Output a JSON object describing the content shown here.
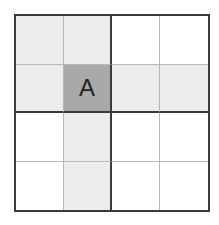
{
  "puzzle": {
    "size": 4,
    "box_size": 2,
    "colors": {
      "border": "#3a3a3a",
      "thin_line": "#b8b8b8",
      "highlight": "#ececec",
      "selected": "#a9a9a9",
      "empty": "#ffffff",
      "text": "#222222"
    },
    "selected_cell": {
      "row": 2,
      "col": 2,
      "label": "A"
    },
    "cells": [
      [
        {
          "text": "",
          "state": "light"
        },
        {
          "text": "",
          "state": "light"
        },
        {
          "text": "",
          "state": "empty"
        },
        {
          "text": "",
          "state": "empty"
        }
      ],
      [
        {
          "text": "",
          "state": "light"
        },
        {
          "text": "A",
          "state": "selected"
        },
        {
          "text": "",
          "state": "light"
        },
        {
          "text": "",
          "state": "light"
        }
      ],
      [
        {
          "text": "",
          "state": "empty"
        },
        {
          "text": "",
          "state": "light"
        },
        {
          "text": "",
          "state": "empty"
        },
        {
          "text": "",
          "state": "empty"
        }
      ],
      [
        {
          "text": "",
          "state": "empty"
        },
        {
          "text": "",
          "state": "light"
        },
        {
          "text": "",
          "state": "empty"
        },
        {
          "text": "",
          "state": "empty"
        }
      ]
    ]
  }
}
